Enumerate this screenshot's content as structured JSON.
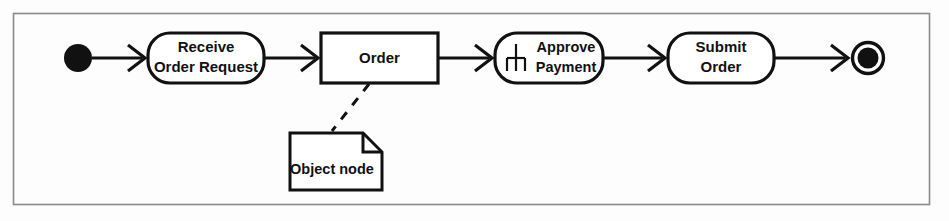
{
  "figure": {
    "kind": "uml-activity-diagram",
    "frame": {
      "x": 13,
      "y": 13,
      "width": 917,
      "height": 192
    },
    "colors": {
      "stroke": "#111111",
      "frame_stroke": "#8a8a8a",
      "background": "#fdfdfd",
      "node_fill": "#ffffff"
    }
  },
  "nodes": {
    "initial": {
      "name": "initial-node",
      "type": "initial",
      "cx": 78,
      "cy": 58,
      "r": 14
    },
    "receive_order_request": {
      "name": "receive-order-request",
      "type": "action",
      "label_line1": "Receive",
      "label_line2": "Order Request",
      "x": 148,
      "y": 33,
      "width": 116,
      "height": 50,
      "rx": 22
    },
    "order": {
      "name": "order-object-node",
      "type": "object",
      "label": "Order",
      "x": 321,
      "y": 33,
      "width": 117,
      "height": 50
    },
    "approve_payment": {
      "name": "approve-payment",
      "type": "call-behavior-action",
      "label_line1": "Approve",
      "label_line2": "Payment",
      "icon": "rake-icon",
      "x": 495,
      "y": 33,
      "width": 108,
      "height": 50,
      "rx": 22
    },
    "submit_order": {
      "name": "submit-order",
      "type": "action",
      "label_line1": "Submit",
      "label_line2": "Order",
      "x": 668,
      "y": 33,
      "width": 106,
      "height": 50,
      "rx": 22
    },
    "final": {
      "name": "final-node",
      "type": "activity-final",
      "cx": 868,
      "cy": 58,
      "r_outer": 17,
      "r_inner": 11
    },
    "object_note": {
      "name": "object-node-note",
      "type": "note",
      "label": "Object node",
      "x": 290,
      "y": 133,
      "width": 92,
      "height": 57,
      "fold": 19
    }
  },
  "edges": [
    {
      "name": "edge-initial-to-receive",
      "from": "initial",
      "to": "receive_order_request",
      "x1": 92,
      "y1": 58,
      "x2": 146,
      "y2": 58,
      "style": "solid"
    },
    {
      "name": "edge-receive-to-order",
      "from": "receive_order_request",
      "to": "order",
      "x1": 264,
      "y1": 58,
      "x2": 319,
      "y2": 58,
      "style": "solid"
    },
    {
      "name": "edge-order-to-approve",
      "from": "order",
      "to": "approve_payment",
      "x1": 438,
      "y1": 58,
      "x2": 493,
      "y2": 58,
      "style": "solid"
    },
    {
      "name": "edge-approve-to-submit",
      "from": "approve_payment",
      "to": "submit_order",
      "x1": 603,
      "y1": 58,
      "x2": 666,
      "y2": 58,
      "style": "solid"
    },
    {
      "name": "edge-submit-to-final",
      "from": "submit_order",
      "to": "final",
      "x1": 774,
      "y1": 58,
      "x2": 849,
      "y2": 58,
      "style": "solid"
    },
    {
      "name": "edge-order-to-note",
      "from": "order",
      "to": "object_note",
      "x1": 368,
      "y1": 84,
      "x2": 333,
      "y2": 130,
      "style": "dashed"
    }
  ]
}
